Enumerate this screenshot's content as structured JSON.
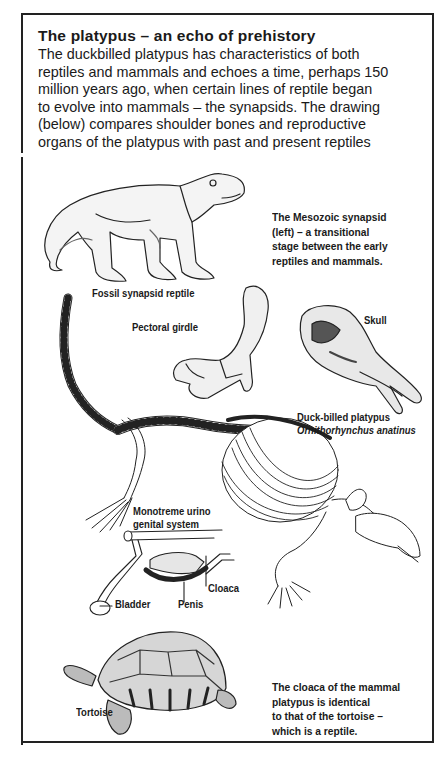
{
  "header": {
    "title": "The platypus – an echo of prehistory",
    "intro_lines": [
      "The duckbilled platypus has characteristics of both",
      "reptiles and mammals and echoes a time, perhaps 150",
      "million years ago, when certain lines of reptile began",
      "to evolve into mammals – the synapsids. The drawing",
      "(below) compares shoulder bones and reproductive",
      "organs of the platypus with past and present reptiles"
    ]
  },
  "captions": {
    "synapsid_note": [
      "The Mesozoic synapsid",
      "(left) – a transitional",
      "stage between the early",
      "reptiles and mammals."
    ],
    "cloaca_note": [
      "The cloaca of the mammal",
      "platypus is identical",
      "to that of the tortoise –",
      "which is a reptile."
    ]
  },
  "labels": {
    "fossil": "Fossil synapsid reptile",
    "pectoral": "Pectoral girdle",
    "skull": "Skull",
    "platypus_common": "Duck-billed platypus",
    "platypus_latin": "Ornithorhynchus anatinus",
    "urino_line1": "Monotreme urino",
    "urino_line2": "genital system",
    "cloaca": "Cloaca",
    "bladder": "Bladder",
    "penis": "Penis",
    "tortoise": "Tortoise"
  },
  "illustrations": [
    "synapsid-reptile-drawing",
    "pectoral-girdle-drawing",
    "platypus-skull-drawing",
    "platypus-skeleton-drawing",
    "urinogenital-system-diagram",
    "tortoise-drawing"
  ]
}
